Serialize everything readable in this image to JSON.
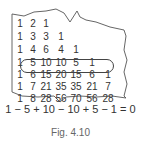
{
  "triangle_rows": [
    [
      "1",
      "2",
      "1"
    ],
    [
      "1",
      "3",
      "3",
      "1"
    ],
    [
      "1",
      "4",
      "6",
      "4",
      "1"
    ],
    [
      "1",
      "5",
      "10",
      "10",
      "5",
      "1"
    ],
    [
      "1",
      "6",
      "15",
      "20",
      "15",
      "6",
      "1"
    ],
    [
      "1",
      "7",
      "21",
      "35",
      "35",
      "21",
      "7"
    ],
    [
      "1",
      "8",
      "28",
      "56",
      "70",
      "56",
      "28"
    ]
  ],
  "highlighted_row_index": 3,
  "equation": "1 − 5 + 10 − 10 + 5 − 1 = 0",
  "caption": "Fig. 4.10"
}
